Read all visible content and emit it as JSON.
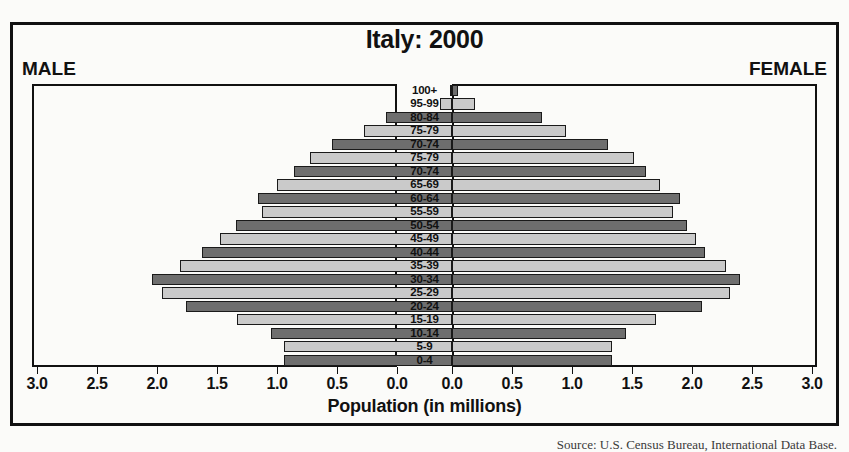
{
  "chart_data": {
    "type": "bar",
    "subtype": "population-pyramid",
    "title": "Italy: 2000",
    "xlabel": "Population (in millions)",
    "ylabel": "",
    "left_series_label": "MALE",
    "right_series_label": "FEMALE",
    "xlim": [
      0,
      3.0
    ],
    "xticks": [
      3.0,
      2.5,
      2.0,
      1.5,
      1.0,
      0.5,
      0.0
    ],
    "xtick_labels_left": [
      "3.0",
      "2.5",
      "2.0",
      "1.5",
      "1.0",
      "0.5",
      "0.0"
    ],
    "xtick_labels_right": [
      "0.0",
      "0.5",
      "1.0",
      "1.5",
      "2.0",
      "2.5",
      "3.0"
    ],
    "grid": false,
    "legend": "none",
    "colors": {
      "dark_bar": "#6e6e6e",
      "light_bar": "#cacaca",
      "outline": "#1a1a1a",
      "text": "#111111",
      "background": "#fbfbf9"
    },
    "categories": [
      "100+",
      "95-99",
      "80-84",
      "75-79",
      "70-74",
      "75-79",
      "70-74",
      "65-69",
      "60-64",
      "55-59",
      "50-54",
      "45-49",
      "40-44",
      "35-39",
      "30-34",
      "25-29",
      "20-24",
      "15-19",
      "10-14",
      "5-9",
      "0-4"
    ],
    "series": [
      {
        "name": "MALE",
        "side": "left",
        "values": [
          0.02,
          0.1,
          0.55,
          0.73,
          1.0,
          1.18,
          1.32,
          1.46,
          1.62,
          1.58,
          1.8,
          1.93,
          2.08,
          2.27,
          2.5,
          2.42,
          2.22,
          1.79,
          1.51,
          1.4,
          1.4
        ]
      },
      {
        "name": "FEMALE",
        "side": "right",
        "values": [
          0.05,
          0.19,
          0.75,
          0.95,
          1.3,
          1.52,
          1.62,
          1.73,
          1.9,
          1.84,
          1.96,
          2.03,
          2.11,
          2.28,
          2.4,
          2.32,
          2.08,
          1.7,
          1.45,
          1.33,
          1.33
        ]
      }
    ],
    "bar_shades": [
      "dark",
      "light",
      "dark",
      "light",
      "dark",
      "light",
      "dark",
      "light",
      "dark",
      "light",
      "dark",
      "light",
      "dark",
      "light",
      "dark",
      "light",
      "dark",
      "light",
      "dark",
      "light",
      "dark"
    ],
    "source_note": "Source: U.S. Census Bureau, International Data Base."
  }
}
